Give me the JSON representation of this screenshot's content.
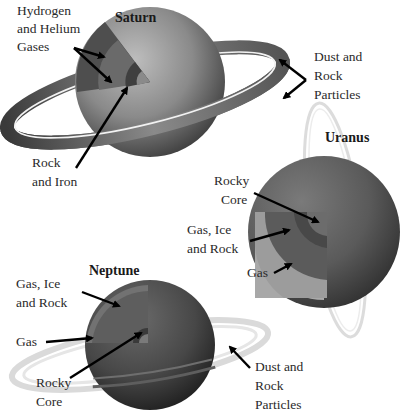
{
  "diagram": {
    "saturn": {
      "title": "Saturn",
      "labels": {
        "gases": [
          "Hydrogen",
          "and Helium",
          "Gases"
        ],
        "core": [
          "Rock",
          "and Iron"
        ],
        "rings": [
          "Dust and",
          "Rock",
          "Particles"
        ]
      }
    },
    "uranus": {
      "title": "Uranus",
      "labels": {
        "core": [
          "Rocky",
          "Core"
        ],
        "mantle": [
          "Gas, Ice",
          "and Rock"
        ],
        "outer": [
          "Gas"
        ]
      }
    },
    "neptune": {
      "title": "Neptune",
      "labels": {
        "mantle": [
          "Gas, Ice",
          "and Rock"
        ],
        "outer": [
          "Gas"
        ],
        "core": [
          "Rocky",
          "Core"
        ],
        "rings": [
          "Dust and",
          "Rock",
          "Particles"
        ]
      }
    },
    "colors": {
      "planet_dark": "#3a3a3a",
      "planet_mid": "#6e6e6e",
      "planet_light": "#a8a8a8",
      "ring_faint": "#d8d8d8",
      "arrow": "#000000"
    }
  }
}
